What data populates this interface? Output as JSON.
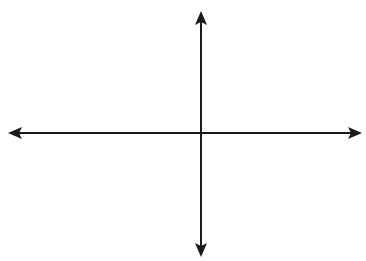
{
  "diagram": {
    "type": "coordinate-plane-quadrilateral",
    "axes": {
      "x_label": "x",
      "y_label": "y",
      "x_range": [
        -6,
        5
      ],
      "y_range": [
        -4,
        4
      ],
      "x_ticks": [
        {
          "value": -5,
          "label": "−5"
        },
        {
          "value": -4,
          "label": "−4"
        },
        {
          "value": -2,
          "label": "−2"
        },
        {
          "value": 1,
          "label": "1"
        },
        {
          "value": 2,
          "label": "2"
        },
        {
          "value": 4,
          "label": "4"
        }
      ],
      "y_ticks": [
        {
          "value": 3,
          "label": "3"
        },
        {
          "value": 1,
          "label": "1"
        },
        {
          "value": -1,
          "label": "−1"
        },
        {
          "value": -3,
          "label": "−3"
        }
      ]
    },
    "points": [
      {
        "name": "A",
        "x": -5,
        "y": 3
      },
      {
        "name": "B",
        "x": 2,
        "y": 2
      },
      {
        "name": "C",
        "x": 4,
        "y": -3
      },
      {
        "name": "D",
        "x": -2,
        "y": -2
      }
    ],
    "polygon": [
      "A",
      "B",
      "C",
      "D"
    ],
    "colors": {
      "grid": "#a9a9a9",
      "axis": "#1a1a1a",
      "polygon": "#5e5e5e",
      "point": "#4f4f4f",
      "label": "#4a4a4a"
    }
  }
}
